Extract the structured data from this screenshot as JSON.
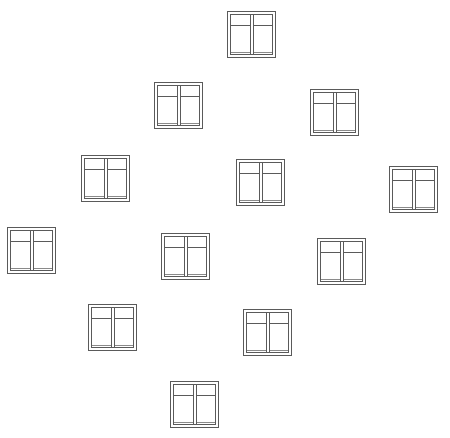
{
  "canvas": {
    "width": 450,
    "height": 438,
    "background": "#ffffff",
    "line_color": "#5a5a5a"
  },
  "icon": {
    "type": "casement-window-icon",
    "width": 49,
    "height": 47,
    "panes": 2,
    "has_transom": true
  },
  "windows": [
    {
      "id": 1,
      "x": 227,
      "y": 11
    },
    {
      "id": 2,
      "x": 154,
      "y": 82
    },
    {
      "id": 3,
      "x": 310,
      "y": 89
    },
    {
      "id": 4,
      "x": 81,
      "y": 155
    },
    {
      "id": 5,
      "x": 236,
      "y": 159
    },
    {
      "id": 6,
      "x": 389,
      "y": 166
    },
    {
      "id": 7,
      "x": 7,
      "y": 227
    },
    {
      "id": 8,
      "x": 161,
      "y": 233
    },
    {
      "id": 9,
      "x": 317,
      "y": 238
    },
    {
      "id": 10,
      "x": 88,
      "y": 304
    },
    {
      "id": 11,
      "x": 243,
      "y": 309
    },
    {
      "id": 12,
      "x": 170,
      "y": 381
    }
  ]
}
